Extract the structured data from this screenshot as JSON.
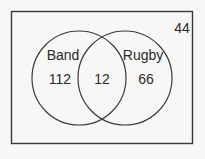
{
  "diagram": {
    "type": "venn",
    "universe_count": "44",
    "sets": [
      {
        "label": "Band",
        "only_count": "112"
      },
      {
        "label": "Rugby",
        "only_count": "66"
      }
    ],
    "intersection_count": "12",
    "colors": {
      "stroke": "#3a3a3a",
      "background": "#f7f7f5",
      "text": "#2a2a2a"
    }
  }
}
